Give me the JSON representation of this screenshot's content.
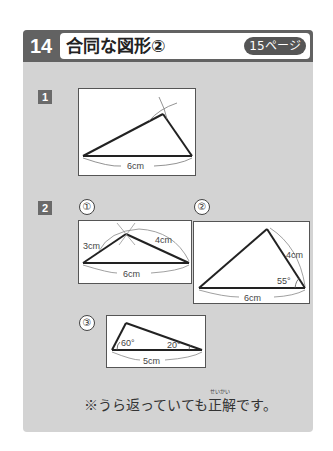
{
  "header": {
    "lesson_number": "14",
    "title": "合同な図形②",
    "page_badge": "15ページ"
  },
  "colors": {
    "panel": "#d3d3d3",
    "header_bar": "#626262",
    "badge": "#555555"
  },
  "questions": [
    {
      "number": "1",
      "figures": [
        {
          "label": "",
          "base": "6cm"
        }
      ]
    },
    {
      "number": "2",
      "figures": [
        {
          "label": "①",
          "left_side": "3cm",
          "right_side": "4cm",
          "base": "6cm"
        },
        {
          "label": "②",
          "right_side": "4cm",
          "angle": "55°",
          "base": "6cm"
        },
        {
          "label": "③",
          "angle_left": "60°",
          "angle_right": "20°",
          "base": "5cm"
        }
      ]
    }
  ],
  "note": {
    "text": "※うら返っていても正解です。",
    "ruby": "せいかい"
  }
}
